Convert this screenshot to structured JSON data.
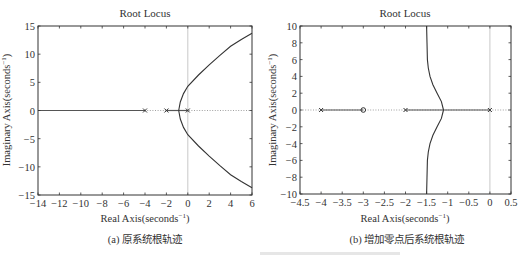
{
  "figure_caption_partial": "",
  "chart_data": [
    {
      "type": "line",
      "panel_caption": "(a) 原系统根轨迹",
      "title": "Root Locus",
      "xlabel": "Real Axis(seconds⁻¹)",
      "ylabel": "Imaginary Axis(seconds⁻¹)",
      "xlim": [
        -14,
        6
      ],
      "ylim": [
        -15,
        15
      ],
      "xticks": [
        -14,
        -12,
        -10,
        -8,
        -6,
        -4,
        -2,
        0,
        2,
        4,
        6
      ],
      "yticks": [
        -15,
        -10,
        -5,
        0,
        5,
        10,
        15
      ],
      "xtick_labels": [
        "−14",
        "−12",
        "−10",
        "−8",
        "−6",
        "−4",
        "−2",
        "0",
        "2",
        "4",
        "6"
      ],
      "ytick_labels": [
        "−15",
        "−10",
        "−5",
        "0",
        "5",
        "10",
        "15"
      ],
      "grid": false,
      "poles": [
        -4,
        -2,
        0
      ],
      "zeros": [],
      "real_axis_segments": [
        [
          -14,
          -4
        ],
        [
          -2,
          0
        ]
      ],
      "breakaway_point": -0.85,
      "series": [
        {
          "name": "branch-upper",
          "x": [
            -0.85,
            -0.7,
            -0.4,
            0,
            1,
            2,
            3,
            4,
            5,
            6
          ],
          "y": [
            0,
            1.5,
            3.0,
            4.3,
            6.3,
            8.1,
            9.8,
            11.4,
            12.6,
            13.7
          ]
        },
        {
          "name": "branch-lower",
          "x": [
            -0.85,
            -0.7,
            -0.4,
            0,
            1,
            2,
            3,
            4,
            5,
            6
          ],
          "y": [
            0,
            -1.5,
            -3.0,
            -4.3,
            -6.3,
            -8.1,
            -9.8,
            -11.4,
            -12.6,
            -13.7
          ]
        }
      ]
    },
    {
      "type": "line",
      "panel_caption": "(b) 增加零点后系统根轨迹",
      "title": "Root Locus",
      "xlabel": "Real Axis(seconds⁻¹)",
      "ylabel": "Imaginary Axis(seconds⁻¹)",
      "xlim": [
        -4.5,
        0.5
      ],
      "ylim": [
        -10,
        10
      ],
      "xticks": [
        -4.5,
        -4,
        -3.5,
        -3,
        -2.5,
        -2,
        -1.5,
        -1,
        -0.5,
        0,
        0.5
      ],
      "yticks": [
        -10,
        -8,
        -6,
        -4,
        -2,
        0,
        2,
        4,
        6,
        8,
        10
      ],
      "xtick_labels": [
        "−4.5",
        "−4",
        "−3.5",
        "−3",
        "−2.5",
        "−2",
        "−1.5",
        "−1",
        "−0.5",
        "0",
        "0.5"
      ],
      "ytick_labels": [
        "−10",
        "−8",
        "−6",
        "−4",
        "−2",
        "0",
        "2",
        "4",
        "6",
        "8",
        "10"
      ],
      "grid": false,
      "poles": [
        -4,
        -2,
        0
      ],
      "zeros": [
        -3
      ],
      "real_axis_segments": [
        [
          -4,
          -3
        ],
        [
          -2,
          0
        ]
      ],
      "breakaway_point": -1.1,
      "asymptote": -1.5,
      "series": [
        {
          "name": "branch-upper",
          "x": [
            -1.1,
            -1.15,
            -1.25,
            -1.35,
            -1.42,
            -1.46,
            -1.48,
            -1.49,
            -1.5
          ],
          "y": [
            0,
            1,
            2,
            3,
            4,
            5,
            6,
            8,
            10
          ]
        },
        {
          "name": "branch-lower",
          "x": [
            -1.1,
            -1.15,
            -1.25,
            -1.35,
            -1.42,
            -1.46,
            -1.48,
            -1.49,
            -1.5
          ],
          "y": [
            0,
            -1,
            -2,
            -3,
            -4,
            -5,
            -6,
            -8,
            -10
          ]
        }
      ]
    }
  ]
}
